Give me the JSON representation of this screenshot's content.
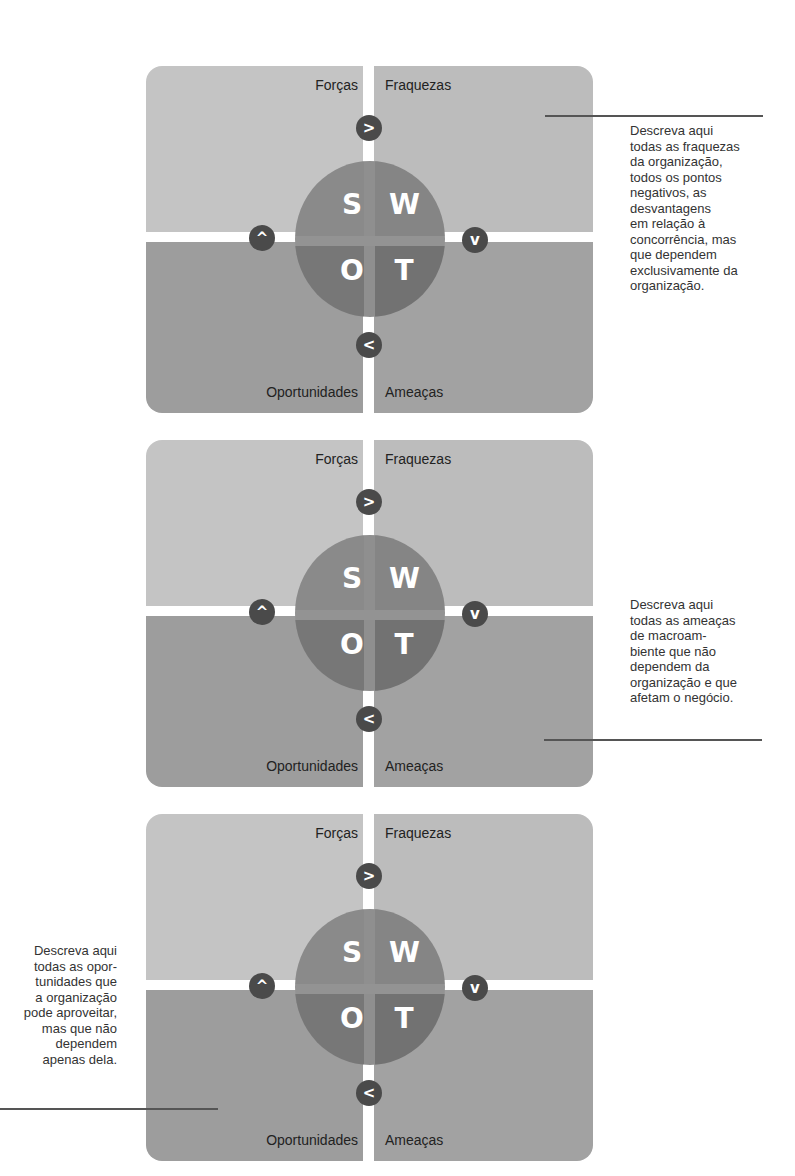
{
  "diagrams": [
    {
      "id": "swot-weaknesses",
      "labels": {
        "s": "Forças",
        "w": "Fraquezas",
        "o": "Oportunidades",
        "t": "Ameaças"
      },
      "letters": {
        "s": "S",
        "w": "W",
        "o": "O",
        "t": "T"
      },
      "badges": {
        "top": ">",
        "left": "^",
        "right": "v",
        "bottom": "<"
      },
      "callout": {
        "target_quadrant": "Fraquezas",
        "lines": [
          "Descreva aqui",
          "todas as fraquezas",
          "da organização,",
          "todos os pontos",
          "negativos, as",
          "desvantagens",
          "em relação à",
          "concorrência, mas",
          "que dependem",
          "exclusivamente da",
          "organização."
        ]
      }
    },
    {
      "id": "swot-threats",
      "labels": {
        "s": "Forças",
        "w": "Fraquezas",
        "o": "Oportunidades",
        "t": "Ameaças"
      },
      "letters": {
        "s": "S",
        "w": "W",
        "o": "O",
        "t": "T"
      },
      "badges": {
        "top": ">",
        "left": "^",
        "right": "v",
        "bottom": "<"
      },
      "callout": {
        "target_quadrant": "Ameaças",
        "lines": [
          "Descreva aqui",
          "todas as ameaças",
          "de macroam-",
          "biente que não",
          "dependem da",
          "organização e que",
          "afetam o negócio."
        ]
      }
    },
    {
      "id": "swot-opportunities",
      "labels": {
        "s": "Forças",
        "w": "Fraquezas",
        "o": "Oportunidades",
        "t": "Ameaças"
      },
      "letters": {
        "s": "S",
        "w": "W",
        "o": "O",
        "t": "T"
      },
      "badges": {
        "top": ">",
        "left": "^",
        "right": "v",
        "bottom": "<"
      },
      "callout": {
        "target_quadrant": "Oportunidades",
        "lines": [
          "Descreva aqui",
          "todas as opor-",
          "tunidades que",
          "a organização",
          "pode aproveitar,",
          "mas que não",
          "dependem",
          "apenas dela."
        ]
      }
    }
  ],
  "colors": {
    "quadrant_s": "#c4c4c4",
    "quadrant_w": "#bcbcbc",
    "quadrant_o": "#9d9d9d",
    "quadrant_t": "#a2a2a2",
    "circle": "#808080",
    "badge": "#4a4a4a",
    "leader_line": "#555555"
  }
}
